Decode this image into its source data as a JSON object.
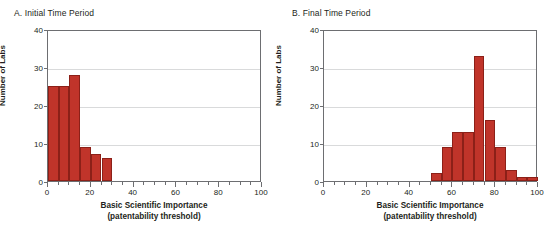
{
  "figure": {
    "background": "#ffffff",
    "bar_color": "#c0342a",
    "bar_edge_color": "#8c2018",
    "axis_color": "#6d6e71",
    "grid_color": "#d9dadb"
  },
  "panels": [
    {
      "id": "panel-a",
      "title": "A. Initial Time Period",
      "ylabel": "Number of Labs",
      "xlabel_line1": "Basic Scientific Importance",
      "xlabel_line2": "(patentability threshold)",
      "ytick_labels": [
        "0",
        "10",
        "20",
        "30",
        "40"
      ],
      "xtick_labels": [
        "0",
        "20",
        "40",
        "60",
        "80",
        "100"
      ]
    },
    {
      "id": "panel-b",
      "title": "B. Final Time Period",
      "ylabel": "Number of Labs",
      "xlabel_line1": "Basic Scientific Importance",
      "xlabel_line2": "(patentability threshold)",
      "ytick_labels": [
        "0",
        "10",
        "20",
        "30",
        "40"
      ],
      "xtick_labels": [
        "0",
        "20",
        "40",
        "60",
        "80",
        "100"
      ]
    }
  ],
  "chart_data": [
    {
      "type": "bar",
      "title": "A. Initial Time Period",
      "xlabel": "Basic Scientific Importance (patentability threshold)",
      "ylabel": "Number of Labs",
      "xlim": [
        0,
        100
      ],
      "ylim": [
        0,
        40
      ],
      "yticks": [
        0,
        10,
        20,
        30,
        40
      ],
      "xticks": [
        0,
        20,
        40,
        60,
        80,
        100
      ],
      "xtick_minor_step": 5,
      "grid": "horizontal",
      "legend": "none",
      "bin_width": 5,
      "bin_edges": [
        0,
        5,
        10,
        15,
        20,
        25,
        30
      ],
      "bin_centers": [
        2.5,
        7.5,
        12.5,
        17.5,
        22.5,
        27.5
      ],
      "values": [
        25,
        25,
        28,
        9,
        7,
        6
      ]
    },
    {
      "type": "bar",
      "title": "B. Final Time Period",
      "xlabel": "Basic Scientific Importance (patentability threshold)",
      "ylabel": "Number of Labs",
      "xlim": [
        0,
        100
      ],
      "ylim": [
        0,
        40
      ],
      "yticks": [
        0,
        10,
        20,
        30,
        40
      ],
      "xticks": [
        0,
        20,
        40,
        60,
        80,
        100
      ],
      "xtick_minor_step": 5,
      "grid": "horizontal",
      "legend": "none",
      "bin_width": 5,
      "bin_edges": [
        50,
        55,
        60,
        65,
        70,
        75,
        80,
        85,
        90,
        95,
        100
      ],
      "bin_centers": [
        52.5,
        57.5,
        62.5,
        67.5,
        72.5,
        77.5,
        82.5,
        87.5,
        92.5,
        97.5
      ],
      "values": [
        2,
        9,
        13,
        13,
        33,
        16,
        9,
        3,
        1,
        1
      ]
    }
  ]
}
